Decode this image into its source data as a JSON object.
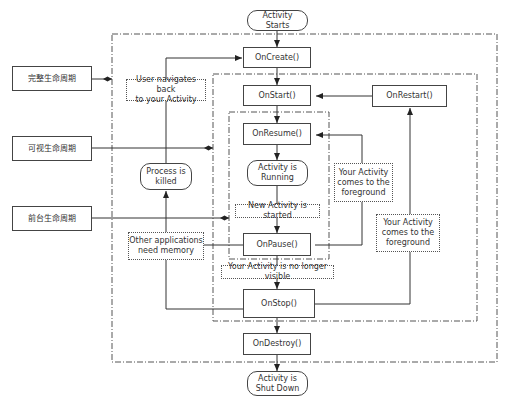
{
  "diagram": {
    "colors": {
      "line": "#333333",
      "box_border": "#444444",
      "frame": "#555555",
      "text": "#333333",
      "background": "#ffffff"
    },
    "lifecycle_labels": [
      {
        "id": "complete",
        "label": "完整生命周期"
      },
      {
        "id": "visible",
        "label": "可视生命周期"
      },
      {
        "id": "foreground",
        "label": "前台生命周期"
      }
    ],
    "terminals": {
      "start": "Activity\nStarts",
      "running": "Activity is\nRunning",
      "killed": "Process is\nkilled",
      "shutdown": "Activity is\nShut Down"
    },
    "callbacks": {
      "on_create": "OnCreate()",
      "on_start": "OnStart()",
      "on_restart": "OnRestart()",
      "on_resume": "OnResume()",
      "on_pause": "OnPause()",
      "on_stop": "OnStop()",
      "on_destroy": "OnDestroy()"
    },
    "notes": {
      "user_navigates_back": "User navigates back\nto your Activity",
      "other_apps_need_memory": "Other applications\nneed memory",
      "new_activity_started": "New Activity is started",
      "no_longer_visible": "Your Activity is no longer visible",
      "comes_to_foreground_1": "Your Activity\ncomes to the\nforeground",
      "comes_to_foreground_2": "Your Activity\ncomes to the\nforeground"
    }
  }
}
